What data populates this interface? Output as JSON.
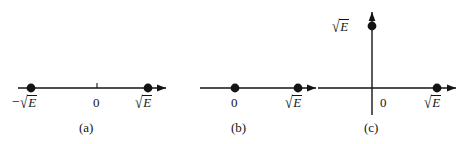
{
  "figure": {
    "type": "math-number-line-diagram",
    "background_color": "#ffffff",
    "ink_color": "#141414",
    "radicand_symbol": "E",
    "sqrt_glyph": "√"
  },
  "panels": [
    {
      "id": "a",
      "caption": "(a)",
      "axis": "real-line",
      "has_left_arrow": false,
      "has_right_arrow": true,
      "origin_label": "0",
      "points": [
        {
          "name": "negative-root",
          "label_minus": "−",
          "label_radicand": "E",
          "side": "left"
        },
        {
          "name": "positive-root",
          "label_minus": "",
          "label_radicand": "E",
          "side": "right"
        }
      ]
    },
    {
      "id": "b",
      "caption": "(b)",
      "axis": "real-line",
      "has_left_arrow": false,
      "has_right_arrow": true,
      "origin_label": "0",
      "points": [
        {
          "name": "origin-root",
          "label_minus": "",
          "label_radicand": "",
          "side": "origin"
        },
        {
          "name": "positive-root",
          "label_minus": "",
          "label_radicand": "E",
          "side": "right"
        }
      ]
    },
    {
      "id": "c",
      "caption": "(c)",
      "axis": "complex-plane",
      "has_left_arrow": true,
      "has_right_arrow": true,
      "has_up_arrow": true,
      "origin_label": "0",
      "points": [
        {
          "name": "imaginary-root",
          "label_minus": "",
          "label_radicand": "E",
          "side": "up"
        },
        {
          "name": "real-root",
          "label_minus": "",
          "label_radicand": "E",
          "side": "right"
        }
      ]
    }
  ],
  "labels": {
    "panel_a_left": {
      "minus": "−",
      "radicand": "E"
    },
    "panel_a_zero": "0",
    "panel_a_right": {
      "minus": "",
      "radicand": "E"
    },
    "panel_a_caption": "(a)",
    "panel_b_zero": "0",
    "panel_b_right": {
      "minus": "",
      "radicand": "E"
    },
    "panel_b_caption": "(b)",
    "panel_c_top": {
      "minus": "",
      "radicand": "E"
    },
    "panel_c_zero": "0",
    "panel_c_right": {
      "minus": "",
      "radicand": "E"
    },
    "panel_c_caption": "(c)"
  }
}
